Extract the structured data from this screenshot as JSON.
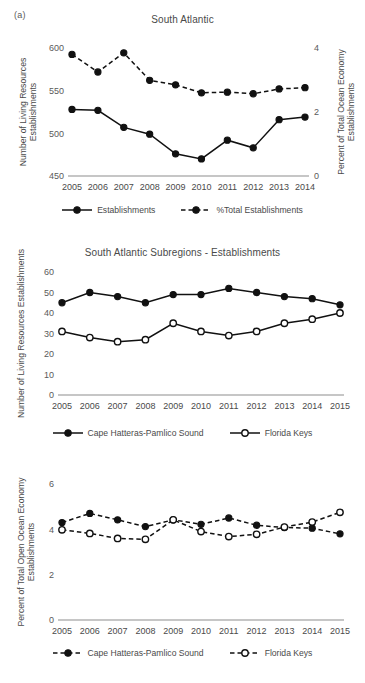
{
  "figure": {
    "sublabel": "(a)"
  },
  "charts": [
    {
      "id": "south-atlantic",
      "title": "South Atlantic",
      "legend": [
        {
          "label": "Establishments",
          "style": "solid",
          "marker": "filled"
        },
        {
          "label": "%Total Establishments",
          "style": "dashed",
          "marker": "filled"
        }
      ]
    },
    {
      "id": "south-atlantic-subregions-establishments",
      "title": "South Atlantic Subregions - Establishments",
      "legend": [
        {
          "label": "Cape Hatteras-Pamlico Sound",
          "style": "solid",
          "marker": "filled"
        },
        {
          "label": "Florida Keys",
          "style": "solid",
          "marker": "open"
        }
      ]
    },
    {
      "id": "south-atlantic-subregions-percent",
      "title": "",
      "legend": [
        {
          "label": "Cape Hatteras-Pamlico Sound",
          "style": "dashed",
          "marker": "filled"
        },
        {
          "label": "Florida Keys",
          "style": "dashed",
          "marker": "open"
        }
      ]
    }
  ],
  "chart_data": [
    {
      "type": "line",
      "title": "South Atlantic",
      "xlabel": "",
      "ylabel": "Number of Living Resources Establishments",
      "y2label": "Percent of Total Ocean Economy Establishments",
      "x": [
        "2005",
        "2006",
        "2007",
        "2008",
        "2009",
        "2010",
        "2011",
        "2012",
        "2013",
        "2014"
      ],
      "ylim": [
        450,
        600
      ],
      "yticks": [
        450,
        500,
        550,
        600
      ],
      "y2lim": [
        0,
        4
      ],
      "y2ticks": [
        0,
        2,
        4
      ],
      "grid": false,
      "legend_position": "bottom",
      "series": [
        {
          "name": "Establishments",
          "axis": "left",
          "style": "solid",
          "marker": "filled",
          "values": [
            528,
            527,
            507,
            499,
            476,
            470,
            492,
            483,
            516,
            519
          ]
        },
        {
          "name": "%Total Establishments",
          "axis": "right",
          "style": "dashed",
          "marker": "filled",
          "values": [
            3.8,
            3.25,
            3.85,
            2.99,
            2.85,
            2.6,
            2.62,
            2.57,
            2.72,
            2.76
          ]
        }
      ]
    },
    {
      "type": "line",
      "title": "South Atlantic Subregions - Establishments",
      "xlabel": "",
      "ylabel": "Number of Living Resources Establishments",
      "x": [
        "2005",
        "2006",
        "2007",
        "2008",
        "2009",
        "2010",
        "2011",
        "2012",
        "2013",
        "2014",
        "2015"
      ],
      "ylim": [
        0,
        60
      ],
      "yticks": [
        0,
        10,
        20,
        30,
        40,
        50,
        60
      ],
      "grid": false,
      "legend_position": "bottom",
      "series": [
        {
          "name": "Cape Hatteras-Pamlico Sound",
          "style": "solid",
          "marker": "filled",
          "values": [
            45,
            50,
            48,
            45,
            49,
            49,
            52,
            50,
            48,
            47,
            44
          ]
        },
        {
          "name": "Florida Keys",
          "style": "solid",
          "marker": "open",
          "values": [
            31,
            28,
            26,
            27,
            35,
            31,
            29,
            31,
            35,
            37,
            40
          ]
        }
      ]
    },
    {
      "type": "line",
      "title": "",
      "xlabel": "",
      "ylabel": "Percent of Total Open Ocean Economy Establishments",
      "x": [
        "2005",
        "2006",
        "2007",
        "2008",
        "2009",
        "2010",
        "2011",
        "2012",
        "2013",
        "2014",
        "2015"
      ],
      "ylim": [
        0,
        6
      ],
      "yticks": [
        0,
        2,
        4,
        6
      ],
      "grid": false,
      "legend_position": "bottom",
      "series": [
        {
          "name": "Cape Hatteras-Pamlico Sound",
          "style": "dashed",
          "marker": "filled",
          "values": [
            4.3,
            4.7,
            4.42,
            4.12,
            4.42,
            4.22,
            4.5,
            4.18,
            4.08,
            4.05,
            3.8
          ]
        },
        {
          "name": "Florida Keys",
          "style": "dashed",
          "marker": "open",
          "values": [
            3.98,
            3.82,
            3.6,
            3.56,
            4.42,
            3.9,
            3.68,
            3.78,
            4.1,
            4.32,
            4.75
          ]
        }
      ]
    }
  ]
}
